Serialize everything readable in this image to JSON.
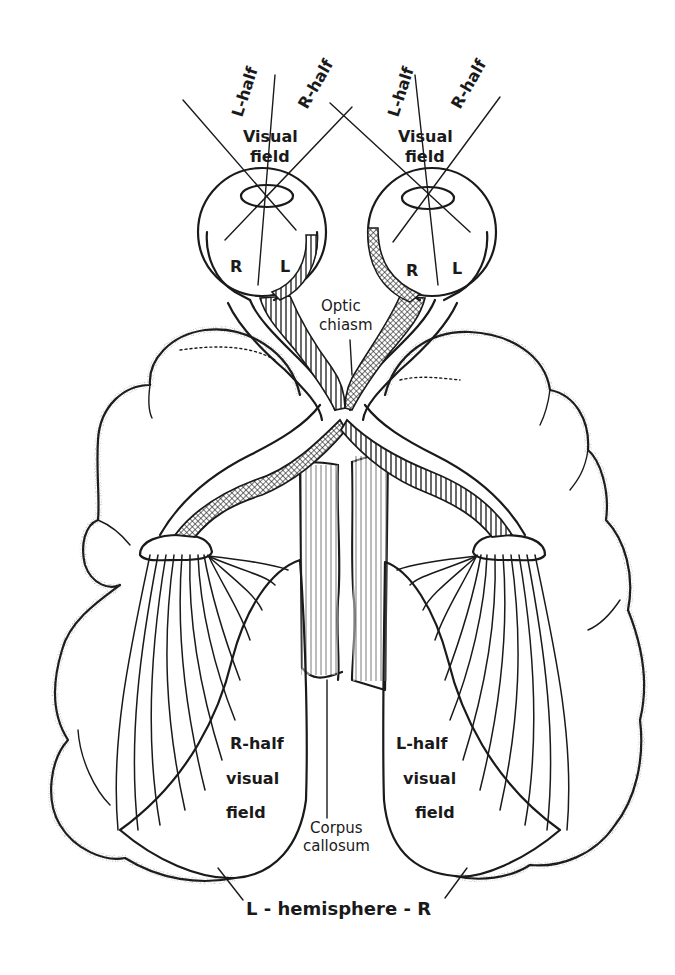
{
  "diagram": {
    "left_eye": {
      "field_labels": [
        "L-half",
        "R-half"
      ],
      "visual_field_label": [
        "Visual",
        "field"
      ],
      "retina_labels": [
        "R",
        "L"
      ]
    },
    "right_eye": {
      "field_labels": [
        "L-half",
        "R-half"
      ],
      "visual_field_label": [
        "Visual",
        "field"
      ],
      "retina_labels": [
        "R",
        "L"
      ]
    },
    "optic_chiasm_label": [
      "Optic",
      "chiasm"
    ],
    "corpus_callosum_label": [
      "Corpus",
      "callosum"
    ],
    "left_hemisphere_field": [
      "R-half",
      "visual",
      "field"
    ],
    "right_hemisphere_field": [
      "L-half",
      "visual",
      "field"
    ],
    "hemisphere_label": "L - hemisphere - R",
    "colors": {
      "ink": "#1a1a1a",
      "background": "#ffffff"
    }
  }
}
